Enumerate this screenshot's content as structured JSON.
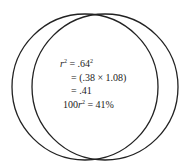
{
  "diagram": {
    "type": "venn-overlap",
    "circles": [
      {
        "name": "left-circle",
        "cx": 85,
        "cy": 87,
        "r": 73
      },
      {
        "name": "right-circle",
        "cx": 105,
        "cy": 87,
        "r": 73
      }
    ],
    "stroke_color": "#222222",
    "equations": [
      {
        "lhs_var": "r",
        "lhs_sup": "2",
        "text": " = .64",
        "sup": "2"
      },
      {
        "text": "= (.38 × 1.08)"
      },
      {
        "text": "= .41"
      },
      {
        "prefix": "100",
        "var": "r",
        "var_sup": "2",
        "text": " = 41%"
      }
    ]
  }
}
